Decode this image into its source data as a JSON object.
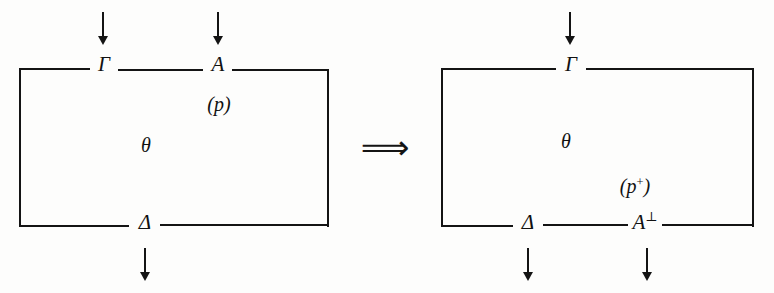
{
  "figure": {
    "ink_color": "#141414",
    "background_color": "#fdfdfc",
    "operator": {
      "symbol": "⟹",
      "name": "implies-double-arrow"
    },
    "left_box": {
      "name": "source-box",
      "top_labels": [
        {
          "text": "Γ",
          "name": "gamma"
        },
        {
          "text": "A",
          "name": "formula-a"
        }
      ],
      "bottom_labels": [
        {
          "text": "Δ",
          "name": "delta"
        }
      ],
      "inner_labels": [
        {
          "text": "θ",
          "name": "theta"
        }
      ],
      "port_label": {
        "text": "(p)",
        "name": "port-p"
      },
      "top_arrows": 2,
      "bottom_arrows": 1
    },
    "right_box": {
      "name": "result-box",
      "top_labels": [
        {
          "text": "Γ",
          "name": "gamma"
        }
      ],
      "bottom_labels": [
        {
          "text": "Δ",
          "name": "delta"
        },
        {
          "text": "A",
          "sup": "⊥",
          "name": "formula-a-perp"
        }
      ],
      "inner_labels": [
        {
          "text": "θ",
          "name": "theta"
        }
      ],
      "port_label": {
        "text": "(p",
        "sup": "+",
        "suffix": ")",
        "name": "port-p-plus"
      },
      "top_arrows": 1,
      "bottom_arrows": 2
    }
  }
}
